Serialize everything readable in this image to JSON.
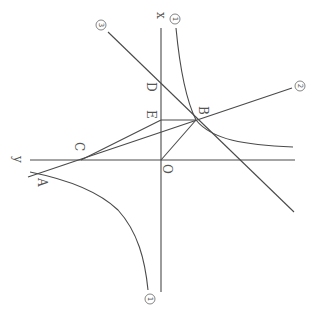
{
  "figure": {
    "rotation_deg": 90,
    "colors": {
      "line": "#4a4a4a",
      "text": "#555555",
      "background": "#ffffff"
    },
    "axes": {
      "x_label": "x",
      "y_label": "y",
      "origin_label": "O"
    },
    "points": {
      "A": "A",
      "B": "B",
      "C": "C",
      "D": "D",
      "E": "E",
      "O": "O"
    },
    "curves": {
      "hyperbola_upper_label": "1",
      "hyperbola_lower_label": "1",
      "line2_label": "2",
      "line3_label": "3"
    }
  }
}
